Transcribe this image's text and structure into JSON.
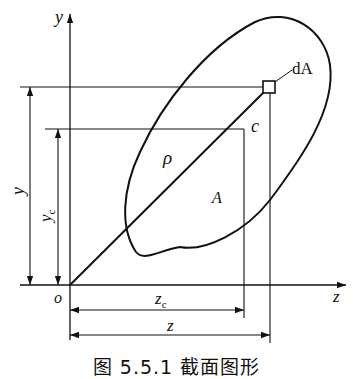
{
  "figure": {
    "caption": "图 5.5.1   截面图形",
    "axes": {
      "y_label": "y",
      "z_label": "z",
      "origin_label": "o"
    },
    "labels": {
      "element": "dA",
      "centroid": "c",
      "radius": "ρ",
      "area": "A",
      "y_dim": "y",
      "yc_dim_main": "y",
      "yc_dim_sub": "c",
      "zc_dim_main": "z",
      "zc_dim_sub": "c",
      "z_dim": "z"
    },
    "colors": {
      "stroke": "#111111",
      "background": "#ffffff"
    }
  }
}
